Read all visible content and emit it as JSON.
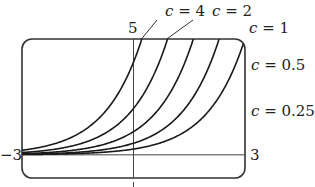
{
  "chart_data": {
    "type": "line",
    "title": "",
    "function": "y = c·e^x",
    "xlabel": "",
    "ylabel": "",
    "xlim": [
      -3,
      3
    ],
    "ylim": [
      -1,
      5
    ],
    "grid": false,
    "tick_labels": {
      "xmin": "−3",
      "xmax": "3",
      "ymax": "5",
      "ymin": "−1"
    },
    "series": [
      {
        "name": "c = 4",
        "c": 4
      },
      {
        "name": "c = 2",
        "c": 2
      },
      {
        "name": "c = 1",
        "c": 1
      },
      {
        "name": "c = 0.5",
        "c": 0.5
      },
      {
        "name": "c = 0.25",
        "c": 0.25
      }
    ],
    "annotations": [
      {
        "text": "c = 4",
        "x": 165,
        "y": 16
      },
      {
        "text": "c = 2",
        "x": 212,
        "y": 16
      },
      {
        "text": "c = 1",
        "x": 249,
        "y": 33
      },
      {
        "text": "c = 0.5",
        "x": 251,
        "y": 70
      },
      {
        "text": "c = 0.25",
        "x": 251,
        "y": 116
      }
    ],
    "colors": {
      "line": "#1a1a1a",
      "frame": "#333333",
      "background": "#ffffff"
    }
  }
}
